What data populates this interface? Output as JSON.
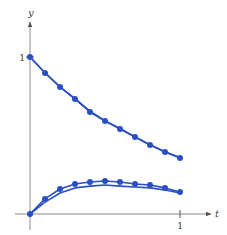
{
  "chart_data": {
    "type": "line",
    "title": "",
    "xlabel": "t",
    "ylabel": "y",
    "xlim": [
      0,
      1.15
    ],
    "ylim": [
      0,
      1.1
    ],
    "x_ticks": [
      {
        "value": 1,
        "label": "1"
      }
    ],
    "y_ticks": [
      {
        "value": 1,
        "label": "1"
      }
    ],
    "grid": false,
    "legend": null,
    "x": [
      0,
      0.1,
      0.2,
      0.3,
      0.4,
      0.5,
      0.6,
      0.7,
      0.8,
      0.9,
      1.0
    ],
    "series": [
      {
        "name": "upper-approximation",
        "style": "dots",
        "values": [
          1.0,
          0.898,
          0.809,
          0.732,
          0.65,
          0.592,
          0.541,
          0.49,
          0.439,
          0.395,
          0.357
        ]
      },
      {
        "name": "upper-exact",
        "style": "line",
        "values": [
          1.0,
          0.9,
          0.81,
          0.735,
          0.655,
          0.595,
          0.545,
          0.492,
          0.442,
          0.397,
          0.36
        ]
      },
      {
        "name": "lower-approximation",
        "style": "dots",
        "values": [
          0.0,
          0.096,
          0.159,
          0.191,
          0.204,
          0.21,
          0.204,
          0.191,
          0.185,
          0.166,
          0.14
        ]
      },
      {
        "name": "lower-exact",
        "style": "line",
        "values": [
          0.0,
          0.076,
          0.134,
          0.166,
          0.178,
          0.185,
          0.178,
          0.172,
          0.166,
          0.153,
          0.134
        ]
      }
    ]
  },
  "labels": {
    "x_axis": "t",
    "y_axis": "y",
    "x_tick_1": "1",
    "y_tick_1": "1"
  },
  "colors": {
    "curve": "#2a4fc4",
    "axis": "#8a8a8a"
  }
}
